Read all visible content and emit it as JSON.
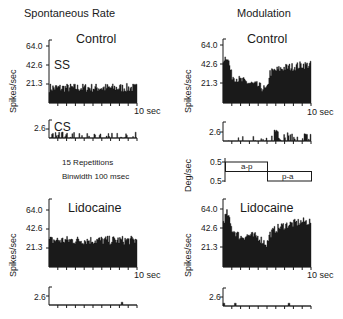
{
  "columns": {
    "left_title": "Spontaneous Rate",
    "right_title": "Modulation"
  },
  "conditions": {
    "control": "Control",
    "lidocaine": "Lidocaine"
  },
  "labels": {
    "ss": "SS",
    "cs": "CS",
    "spikes_axis": "Spikes/sec",
    "deg_axis": "Deg/sec",
    "time_end": "10 sec",
    "repetitions": "15 Repetitions",
    "binwidth": "Binwidth 100 msec",
    "ap": "a-p",
    "pa": "p-a"
  },
  "ticks": {
    "ss": [
      "64.0",
      "42.6",
      "21.3"
    ],
    "cs": "2.6",
    "deg_top": "0.5",
    "deg_bottom": "0.5"
  },
  "chart_data": [
    {
      "id": "spontaneous-control-ss",
      "type": "bar",
      "title": "Control",
      "series_label": "SS",
      "xlabel": "10 sec",
      "ylabel": "Spikes/sec",
      "ylim": [
        0,
        64.0
      ],
      "yticks": [
        21.3,
        42.6,
        64.0
      ],
      "x_range_sec": [
        0,
        10
      ],
      "bins": 100,
      "profile": "flat",
      "mean": 17,
      "jitter": 5
    },
    {
      "id": "spontaneous-control-cs",
      "type": "bar",
      "series_label": "CS",
      "ylim": [
        0,
        5.2
      ],
      "yticks": [
        2.6
      ],
      "x_range_sec": [
        0,
        10
      ],
      "bins": 100,
      "profile": "sparse",
      "mean": 0.6,
      "jitter": 0.8
    },
    {
      "id": "spontaneous-lidocaine-ss",
      "type": "bar",
      "title": "Lidocaine",
      "xlabel": "10 sec",
      "ylabel": "Spikes/sec",
      "ylim": [
        0,
        64.0
      ],
      "yticks": [
        21.3,
        42.6,
        64.0
      ],
      "x_range_sec": [
        0,
        10
      ],
      "bins": 100,
      "profile": "flat",
      "mean": 30,
      "jitter": 5
    },
    {
      "id": "spontaneous-lidocaine-cs",
      "type": "bar",
      "ylim": [
        0,
        5.2
      ],
      "yticks": [
        2.6
      ],
      "x_range_sec": [
        0,
        10
      ],
      "bins": 100,
      "profile": "single",
      "peaks_sec": [
        8.3
      ]
    },
    {
      "id": "modulation-control-ss",
      "type": "bar",
      "title": "Control",
      "xlabel": "10 sec",
      "ylabel": "Spikes/sec",
      "ylim": [
        0,
        64.0
      ],
      "yticks": [
        21.3,
        42.6,
        64.0
      ],
      "x_range_sec": [
        0,
        10
      ],
      "bins": 100,
      "profile": "modulated",
      "points_sec": [
        0,
        0.5,
        1,
        2,
        3,
        4,
        5,
        5.3,
        6,
        7,
        8,
        9,
        10
      ],
      "points_val": [
        48,
        52,
        30,
        25,
        22,
        19,
        14,
        33,
        36,
        39,
        40,
        42,
        42
      ]
    },
    {
      "id": "modulation-control-cs",
      "type": "bar",
      "ylim": [
        0,
        5.2
      ],
      "yticks": [
        2.6
      ],
      "x_range_sec": [
        0,
        10
      ],
      "bins": 100,
      "profile": "modulated-sparse",
      "note": "sparse early, burst after ~5.5 sec peaking ~3.2"
    },
    {
      "id": "modulation-stimulus",
      "type": "line",
      "ylabel": "Deg/sec",
      "ylim": [
        -0.5,
        0.5
      ],
      "yticks": [
        -0.5,
        0.5
      ],
      "segments": [
        {
          "label": "a-p",
          "from_sec": 0,
          "to_sec": 5,
          "value": 0.5
        },
        {
          "label": "p-a",
          "from_sec": 5,
          "to_sec": 10,
          "value": -0.5
        }
      ]
    },
    {
      "id": "modulation-lidocaine-ss",
      "type": "bar",
      "title": "Lidocaine",
      "xlabel": "10 sec",
      "ylabel": "Spikes/sec",
      "ylim": [
        0,
        64.0
      ],
      "yticks": [
        21.3,
        42.6,
        64.0
      ],
      "x_range_sec": [
        0,
        10
      ],
      "bins": 100,
      "profile": "modulated",
      "points_sec": [
        0,
        0.5,
        1,
        2,
        3,
        4,
        5,
        5.3,
        6,
        7,
        8,
        9,
        10
      ],
      "points_val": [
        50,
        60,
        42,
        33,
        35,
        33,
        25,
        36,
        42,
        46,
        48,
        50,
        50
      ]
    },
    {
      "id": "modulation-lidocaine-cs",
      "type": "bar",
      "ylim": [
        0,
        5.2
      ],
      "yticks": [
        2.6
      ],
      "x_range_sec": [
        0,
        10
      ],
      "bins": 100,
      "profile": "single",
      "peaks_sec": [
        0.1,
        1.4,
        7.5
      ]
    }
  ]
}
